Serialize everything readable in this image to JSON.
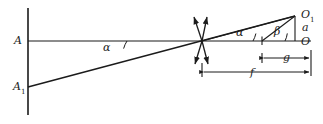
{
  "figure": {
    "kind": "optical-ray-diagram",
    "background_color": "#ffffff",
    "stroke_color": "#1b1b1b",
    "canvas": {
      "width": 323,
      "height": 124
    },
    "labels": {
      "point_A": "A",
      "point_A1_base": "A",
      "point_A1_sub": "1",
      "point_O1_base": "O",
      "point_O1_sub": "1",
      "point_O": "O",
      "height_a": "a",
      "angle_alpha_left": "α",
      "angle_alpha_right": "α",
      "angle_beta": "β",
      "dimension_f": "f",
      "dimension_g": "g"
    },
    "geometry": {
      "vertical_axis": {
        "x": 28,
        "y_top": 8,
        "y_bottom": 115
      },
      "optical_axis": {
        "x_start": 28,
        "x_end": 311,
        "y": 41
      },
      "ray_from_A1": {
        "x1": 28,
        "y1": 87,
        "x2": 295,
        "y2": 16
      },
      "ray_to_O1": {
        "x1": 202,
        "y1": 41,
        "x2": 295,
        "y2": 16
      },
      "beta_ray": {
        "x1": 262,
        "y1": 41,
        "x2": 295,
        "y2": 16
      },
      "vertical_a": {
        "x": 295,
        "y_top": 16,
        "y_bottom": 41
      },
      "cross_point": {
        "x": 202,
        "y": 41
      },
      "tick_mark": {
        "x": 262,
        "y": 41
      },
      "dimension_f_line": {
        "x1": 202,
        "x2": 311,
        "y": 72
      },
      "dimension_g_line": {
        "x1": 262,
        "x2": 311,
        "y": 58
      },
      "cross_arrows_count": 4
    }
  }
}
